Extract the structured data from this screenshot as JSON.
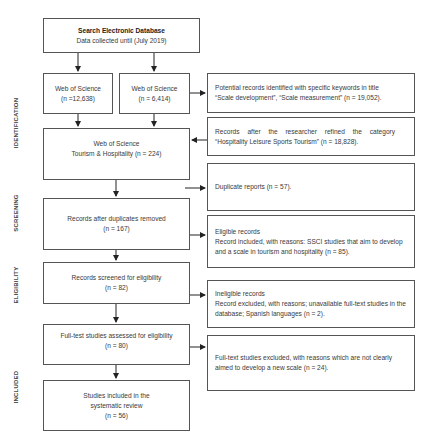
{
  "diagram": {
    "type": "PRISMA flow diagram",
    "stages": [
      "IDENTIFICATION",
      "SCREENING",
      "ELIGIBILITY",
      "INCLUDED"
    ],
    "nodes": {
      "search": {
        "title": "Search Electronic Database",
        "subtitle": "Data collected until (July 2019)"
      },
      "wos_a": {
        "line1": "Web of Science",
        "line2": "(n =12,638)"
      },
      "wos_b": {
        "line1": "Web of Science",
        "line2": "(n = 6,414)"
      },
      "keywords": {
        "line1": "Potential records identified with specific keywords in title",
        "line2": "“Scale development”, “Scale measurement” (n = 19,052)."
      },
      "refined": {
        "line1": "Records after the researcher refined the category",
        "line2": "“Hospitality Leisure Sports Tourism” (n = 18,828)."
      },
      "wos_th": {
        "line1": "Web of Science",
        "line2": "Tourism & Hospitality (n = 224)"
      },
      "duplicates": {
        "line1": "Duplicate reports (n = 57)."
      },
      "after_dup": {
        "line1": "Records after duplicates removed",
        "line2": "(n = 167)"
      },
      "eligible": {
        "line1": "Eligible records",
        "line2": "Record included, with reasons: SSCI studies that aim to develop and a scale in tourism and hospitality (n = 85)."
      },
      "screened": {
        "line1": "Records screened for eligibility",
        "line2": "(n = 82)"
      },
      "ineligible": {
        "line1": "Ineligible records",
        "line2": "Record excluded, with reasons; unavailable full-text studies in the database; Spanish languages (n = 2)."
      },
      "fulltext": {
        "line1": "Full-test studies assessed for eligibility",
        "line2": "(n = 80)"
      },
      "excluded": {
        "line1": "Full-text studies excluded, with reasons which are not clearly aimed to develop a new scale (n = 24)."
      },
      "included": {
        "line1": "Studies included in the",
        "line2": "systematic review",
        "line3": "(n = 56)"
      }
    }
  }
}
